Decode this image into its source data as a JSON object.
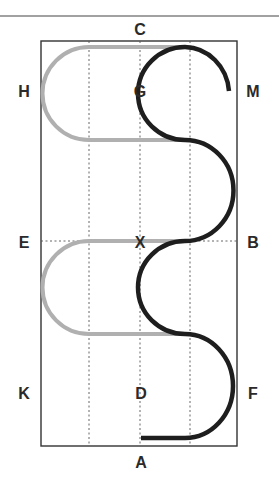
{
  "diagram": {
    "type": "dressage-arena",
    "colors": {
      "border": "#333333",
      "grid": "#555555",
      "path_primary": "#1e1e1e",
      "path_secondary": "#b0b0b0",
      "label": "#2a2a2a"
    },
    "letters": {
      "top": "C",
      "bottom": "A",
      "left_upper": "H",
      "left_middle": "E",
      "left_lower": "K",
      "right_upper": "M",
      "right_middle": "B",
      "right_lower": "F",
      "center_upper": "G",
      "center_middle": "X",
      "center_lower": "D"
    },
    "paths": [
      {
        "name": "serpentine-loops",
        "style": "dark",
        "description": "Four-loop serpentine from A toward M"
      },
      {
        "name": "half-circles-left",
        "style": "light",
        "description": "Two half circles on left side"
      }
    ]
  }
}
